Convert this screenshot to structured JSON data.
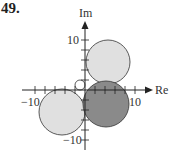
{
  "problem_number": "49.",
  "axes": {
    "x_label": "Re",
    "y_label": "Im",
    "x_ticks": [
      {
        "value": -10,
        "label": "−10"
      },
      {
        "value": 10,
        "label": "10"
      }
    ],
    "y_ticks": [
      {
        "value": 10,
        "label": "10"
      },
      {
        "value": -10,
        "label": "−10"
      }
    ],
    "tick_step": 2
  },
  "colors": {
    "light_fill": "#e0e0e0",
    "dark_fill": "#8a8a8a",
    "stroke": "#333333"
  },
  "circles": [
    {
      "name": "upper-circle",
      "center": [
        4.5,
        5.5
      ],
      "radius": 4.4,
      "shade": "light"
    },
    {
      "name": "dark-circle",
      "center": [
        4.2,
        -2.8
      ],
      "radius": 4.6,
      "shade": "dark"
    },
    {
      "name": "lower-left-circle",
      "center": [
        -4.6,
        -4.4
      ],
      "radius": 4.6,
      "shade": "light"
    },
    {
      "name": "small-circle",
      "center": [
        -1.0,
        1.0
      ],
      "radius": 1.0,
      "shade": "none"
    }
  ]
}
